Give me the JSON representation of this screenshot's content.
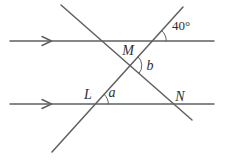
{
  "diagram": {
    "type": "parallel-lines-two-transversals-angle-figure",
    "labels": {
      "top_angle": "40°",
      "point_m": "M",
      "angle_b": "b",
      "point_l": "L",
      "angle_a": "a",
      "point_n": "N"
    },
    "icons": {
      "parallel_mark": "right-chevron-arrow"
    },
    "colors": {
      "line": "#5f6062",
      "arc": "#6a6b6d",
      "text": "#2e2e2e",
      "background": "#ffffff"
    }
  }
}
